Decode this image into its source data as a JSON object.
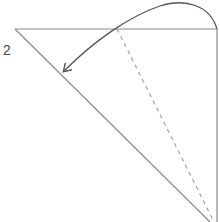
{
  "diagram": {
    "step_label": "2",
    "colors": {
      "line": "#8a8a8a",
      "dashed": "#9a9a9a",
      "arrow": "#555555",
      "text": "#444444",
      "background": "#ffffff"
    },
    "elements": [
      {
        "type": "solid-line",
        "name": "top-edge",
        "from": [
          15,
          29
        ],
        "to": [
          217,
          29
        ]
      },
      {
        "type": "solid-line",
        "name": "right-edge",
        "from": [
          217,
          29
        ],
        "to": [
          217,
          222
        ]
      },
      {
        "type": "solid-line",
        "name": "diagonal-edge",
        "from": [
          15,
          29
        ],
        "to": [
          210,
          222
        ]
      },
      {
        "type": "dashed-line",
        "name": "fold-line",
        "from": [
          117,
          29
        ],
        "to": [
          214,
          222
        ]
      },
      {
        "type": "curved-arrow",
        "name": "fold-direction-arrow",
        "from": [
          217,
          29
        ],
        "to": [
          64,
          71
        ]
      }
    ]
  }
}
